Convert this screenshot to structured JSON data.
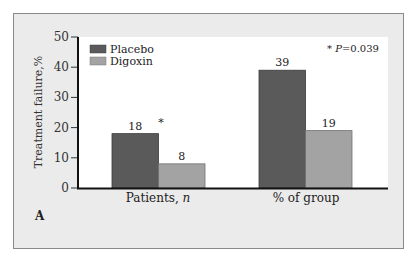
{
  "chart_data": {
    "type": "bar",
    "title": "",
    "xlabel": "",
    "ylabel": "Treatment failure,%",
    "ylim": [
      0,
      50
    ],
    "yticks": [
      0,
      10,
      20,
      30,
      40,
      50
    ],
    "categories": [
      "Patients, n",
      "% of group"
    ],
    "series": [
      {
        "name": "Placebo",
        "color": "#5a5a5a",
        "values": [
          18,
          39
        ]
      },
      {
        "name": "Digoxin",
        "color": "#a3a3a3",
        "values": [
          8,
          19
        ]
      }
    ],
    "annotations": {
      "significance_marker": "*",
      "significance_note": "* P = 0.039",
      "panel_label": "A"
    },
    "legend": "top-left",
    "grid": false
  }
}
